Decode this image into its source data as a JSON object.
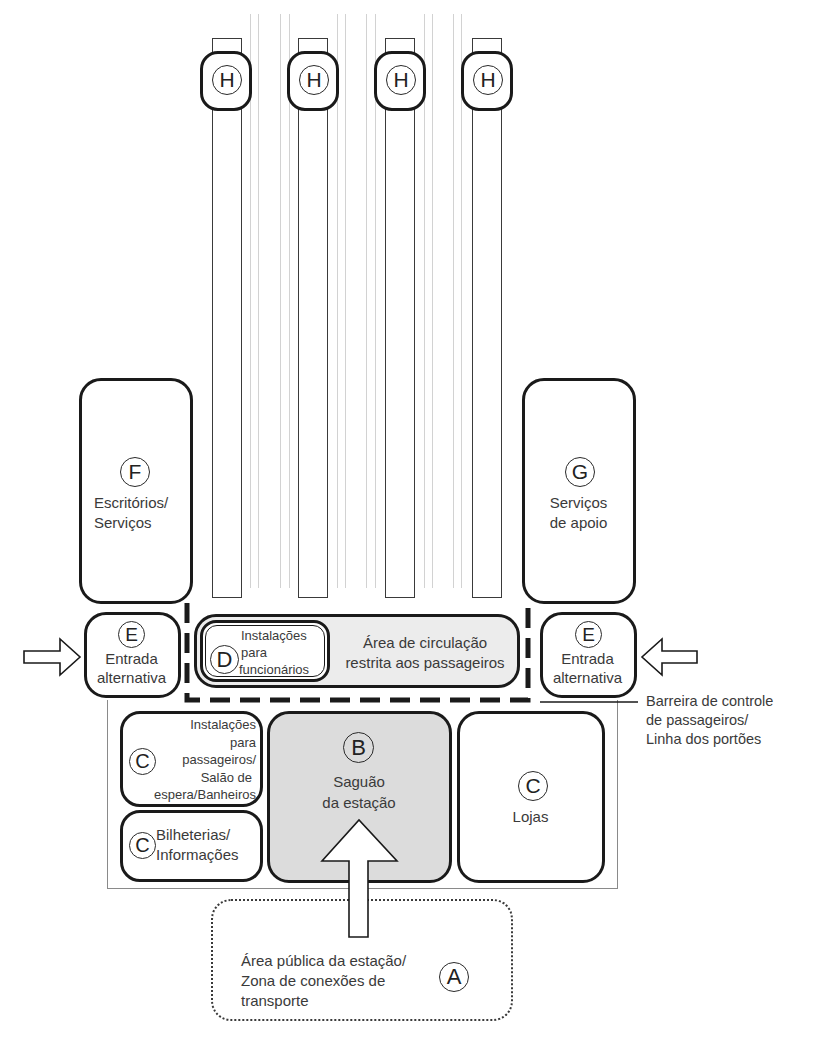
{
  "diagram": {
    "type": "railway-station-zoning-diagram",
    "colors": {
      "line": "#1a1a1a",
      "text": "#3a3a3a",
      "concourse_fill": "#dcdcdc",
      "restricted_fill": "#ececec",
      "track_rails": "#d2d2d2"
    },
    "platforms": [
      {
        "marker": "H"
      },
      {
        "marker": "H"
      },
      {
        "marker": "H"
      },
      {
        "marker": "H"
      }
    ],
    "zones": {
      "F": {
        "marker": "F",
        "line1": "Escritórios/",
        "line2": "Serviços"
      },
      "G": {
        "marker": "G",
        "line1": "Serviços",
        "line2": "de apoio"
      },
      "E_left": {
        "marker": "E",
        "line1": "Entrada",
        "line2": "alternativa"
      },
      "E_right": {
        "marker": "E",
        "line1": "Entrada",
        "line2": "alternativa"
      },
      "D": {
        "marker": "D",
        "line1": "Instalações",
        "line2": "para",
        "line3": "funcionários"
      },
      "restricted": {
        "line1": "Área de circulação",
        "line2": "restrita aos passageiros"
      },
      "C_facilities": {
        "marker": "C",
        "line1": "Instalações",
        "line2": "para",
        "line3": "passageiros/",
        "line4": "Salão de",
        "line5": "espera/Banheiros"
      },
      "C_tickets": {
        "marker": "C",
        "line1": "Bilheterias/",
        "line2": "Informações"
      },
      "B": {
        "marker": "B",
        "line1": "Saguão",
        "line2": "da estação"
      },
      "C_shops": {
        "marker": "C",
        "line1": "Lojas"
      },
      "A": {
        "marker": "A",
        "line1": "Área pública da estação/",
        "line2": "Zona de conexões de",
        "line3": "transporte"
      }
    },
    "annotations": {
      "barrier": {
        "line1": "Barreira de controle",
        "line2": "de passageiros/",
        "line3": "Linha dos portões"
      }
    }
  }
}
